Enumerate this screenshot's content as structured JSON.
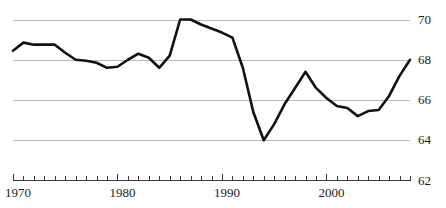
{
  "chart_data": {
    "type": "line",
    "title": "",
    "subtitle": "",
    "xlabel": "",
    "ylabel": "",
    "xlim": [
      1970,
      2008
    ],
    "ylim": [
      62,
      70
    ],
    "grid": true,
    "legend": false,
    "yticks": [
      70,
      68,
      66,
      64,
      62
    ],
    "ytick_labels": [
      "70",
      "68",
      "66",
      "64",
      "62"
    ],
    "xticks": [
      1970,
      1980,
      1990,
      2000
    ],
    "xtick_labels": [
      "1970",
      "1980",
      "1990",
      "2000"
    ],
    "minor_xtick_interval": 1,
    "line_color": "#111111",
    "grid_color": "#b9b9b9",
    "axis_color": "#3a3a3a",
    "x": [
      1970,
      1971,
      1972,
      1973,
      1974,
      1975,
      1976,
      1977,
      1978,
      1979,
      1980,
      1981,
      1982,
      1983,
      1984,
      1985,
      1986,
      1987,
      1988,
      1989,
      1990,
      1991,
      1992,
      1993,
      1994,
      1995,
      1996,
      1997,
      1998,
      1999,
      2000,
      2001,
      2002,
      2003,
      2004,
      2005,
      2006,
      2007,
      2008
    ],
    "values": [
      68.45,
      68.85,
      68.75,
      68.75,
      68.75,
      68.35,
      68.0,
      67.95,
      67.85,
      67.6,
      67.65,
      68.0,
      68.3,
      68.1,
      67.6,
      68.2,
      70.0,
      70.0,
      69.75,
      69.55,
      69.35,
      69.1,
      67.6,
      65.4,
      64.0,
      64.8,
      65.8,
      66.6,
      67.4,
      66.6,
      66.1,
      65.7,
      65.6,
      65.2,
      65.45,
      65.5,
      66.2,
      67.2,
      68.0
    ]
  }
}
